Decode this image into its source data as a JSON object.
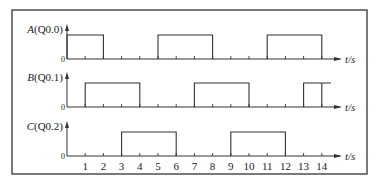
{
  "diagram": {
    "type": "timing-diagram",
    "x_unit_label": "t/s",
    "zero_label": "0",
    "ticks": [
      1,
      2,
      3,
      4,
      5,
      6,
      7,
      8,
      9,
      10,
      11,
      12,
      13,
      14
    ],
    "signals": [
      {
        "name": "A",
        "address": "(Q0.0)",
        "high_intervals": [
          [
            0,
            2
          ],
          [
            5,
            8
          ],
          [
            11,
            14
          ]
        ]
      },
      {
        "name": "B",
        "address": "(Q0.1)",
        "high_intervals": [
          [
            1,
            4
          ],
          [
            7,
            10
          ],
          [
            13,
            14.5
          ]
        ],
        "extra_edges": [
          14
        ]
      },
      {
        "name": "C",
        "address": "(Q0.2)",
        "high_intervals": [
          [
            3,
            6
          ],
          [
            9,
            12
          ]
        ]
      }
    ]
  },
  "colors": {
    "line": "#333333",
    "background": "#ffffff"
  }
}
